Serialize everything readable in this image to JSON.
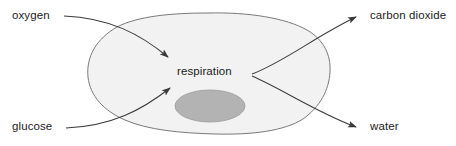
{
  "diagram": {
    "canvas": {
      "width": 456,
      "height": 146,
      "background": "#ffffff"
    },
    "colors": {
      "cell_fill": "#f2f2f2",
      "cell_stroke": "#6b6b6b",
      "nucleus_fill": "#b3b3b3",
      "nucleus_stroke": "#9a9a9a",
      "arrow_stroke": "#3a3a3a",
      "text": "#1b1b1b"
    },
    "center_process": {
      "label": "respiration"
    },
    "inputs": [
      {
        "id": "oxygen",
        "label": "oxygen",
        "position": "top-left"
      },
      {
        "id": "glucose",
        "label": "glucose",
        "position": "bottom-left"
      }
    ],
    "outputs": [
      {
        "id": "carbon-dioxide",
        "label": "carbon dioxide",
        "position": "top-right"
      },
      {
        "id": "water",
        "label": "water",
        "position": "bottom-right"
      }
    ],
    "shapes": {
      "cell": {
        "name": "cell-membrane",
        "fill": "#f2f2f2",
        "stroke": "#6b6b6b"
      },
      "nucleus": {
        "name": "nucleus",
        "fill": "#b3b3b3",
        "stroke": "#9a9a9a"
      }
    },
    "arrows": [
      {
        "id": "oxygen-to-respiration",
        "from": "oxygen",
        "to": "respiration",
        "direction": "in"
      },
      {
        "id": "glucose-to-respiration",
        "from": "glucose",
        "to": "respiration",
        "direction": "in"
      },
      {
        "id": "respiration-to-carbon-dioxide",
        "from": "respiration",
        "to": "carbon dioxide",
        "direction": "out"
      },
      {
        "id": "respiration-to-water",
        "from": "respiration",
        "to": "water",
        "direction": "out"
      }
    ]
  }
}
